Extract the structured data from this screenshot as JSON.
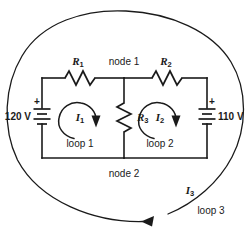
{
  "diagram": {
    "type": "circuit-schematic",
    "colors": {
      "line": "#1a1a1a",
      "background": "#ffffff"
    },
    "components": {
      "resistor_r1": {
        "label": "R",
        "subscript": "1",
        "name": "resistor-r1"
      },
      "resistor_r2": {
        "label": "R",
        "subscript": "2",
        "name": "resistor-r2"
      },
      "resistor_r3": {
        "label": "R",
        "subscript": "3",
        "name": "resistor-r3"
      },
      "battery_left": {
        "value": "120 V",
        "polarity": "+",
        "name": "battery-120v"
      },
      "battery_right": {
        "value": "110 V",
        "polarity": "+",
        "name": "battery-110v"
      }
    },
    "nodes": {
      "node1": "node 1",
      "node2": "node 2"
    },
    "currents": {
      "i1": {
        "label": "I",
        "subscript": "1"
      },
      "i2": {
        "label": "I",
        "subscript": "2"
      },
      "i3": {
        "label": "I",
        "subscript": "3"
      }
    },
    "loops": {
      "loop1": "loop 1",
      "loop2": "loop 2",
      "loop3": "loop 3"
    }
  }
}
